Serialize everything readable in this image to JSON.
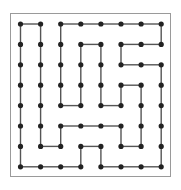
{
  "caption": "",
  "grid": {
    "cols": 8,
    "rows": 8,
    "x0": 20.5,
    "y0": 24,
    "dx": 20.1,
    "dy": 20.4,
    "dot_radius": 2.6,
    "dot_color": "#222222",
    "line_color": "#555555",
    "line_width": 1.4
  },
  "edges": {
    "horizontal": [
      [
        0,
        0,
        1
      ],
      [
        0,
        2,
        3
      ],
      [
        0,
        3,
        4
      ],
      [
        0,
        4,
        5
      ],
      [
        0,
        5,
        6
      ],
      [
        0,
        6,
        7
      ],
      [
        1,
        3,
        4
      ],
      [
        1,
        5,
        6
      ],
      [
        1,
        6,
        7
      ],
      [
        2,
        5,
        6
      ],
      [
        2,
        6,
        7
      ],
      [
        3,
        5,
        6
      ],
      [
        4,
        2,
        3
      ],
      [
        4,
        4,
        5
      ],
      [
        5,
        2,
        3
      ],
      [
        5,
        3,
        4
      ],
      [
        5,
        4,
        5
      ],
      [
        6,
        1,
        2
      ],
      [
        6,
        3,
        4
      ],
      [
        6,
        5,
        6
      ],
      [
        7,
        0,
        1
      ],
      [
        7,
        1,
        2
      ],
      [
        7,
        2,
        3
      ],
      [
        7,
        4,
        5
      ],
      [
        7,
        5,
        6
      ],
      [
        7,
        6,
        7
      ]
    ],
    "vertical": [
      [
        0,
        0,
        1
      ],
      [
        0,
        1,
        2
      ],
      [
        0,
        2,
        3
      ],
      [
        0,
        3,
        4
      ],
      [
        0,
        4,
        5
      ],
      [
        0,
        5,
        6
      ],
      [
        0,
        6,
        7
      ],
      [
        1,
        0,
        1
      ],
      [
        1,
        1,
        2
      ],
      [
        1,
        2,
        3
      ],
      [
        1,
        3,
        4
      ],
      [
        1,
        4,
        5
      ],
      [
        1,
        5,
        6
      ],
      [
        2,
        0,
        1
      ],
      [
        2,
        1,
        2
      ],
      [
        2,
        2,
        3
      ],
      [
        2,
        3,
        4
      ],
      [
        2,
        5,
        6
      ],
      [
        3,
        1,
        2
      ],
      [
        3,
        2,
        3
      ],
      [
        3,
        3,
        4
      ],
      [
        3,
        6,
        7
      ],
      [
        4,
        1,
        2
      ],
      [
        4,
        2,
        3
      ],
      [
        4,
        3,
        4
      ],
      [
        4,
        6,
        7
      ],
      [
        5,
        1,
        2
      ],
      [
        5,
        3,
        4
      ],
      [
        5,
        5,
        6
      ],
      [
        6,
        3,
        4
      ],
      [
        6,
        4,
        5
      ],
      [
        6,
        5,
        6
      ],
      [
        7,
        0,
        1
      ],
      [
        7,
        2,
        3
      ],
      [
        7,
        3,
        4
      ],
      [
        7,
        4,
        5
      ],
      [
        7,
        5,
        6
      ],
      [
        7,
        6,
        7
      ]
    ]
  }
}
